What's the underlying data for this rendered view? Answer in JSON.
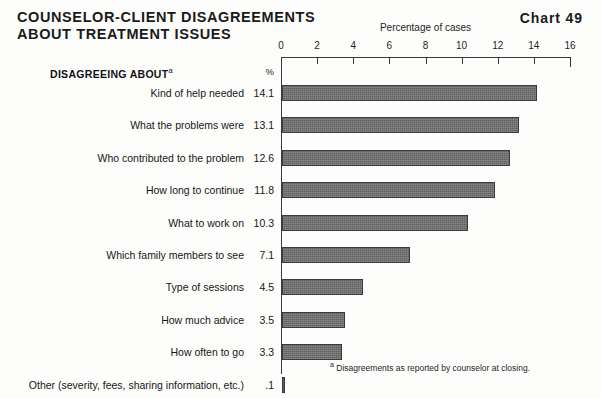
{
  "header": {
    "title_line_1": "COUNSELOR-CLIENT DISAGREEMENTS",
    "title_line_2": "ABOUT TREATMENT ISSUES",
    "chart_number": "Chart 49"
  },
  "columns": {
    "category_heading": "DISAGREEING ABOUT",
    "category_heading_marker": "a",
    "value_heading": "%"
  },
  "footnote": {
    "marker": "a",
    "text": "Disagreements as reported by counselor at closing."
  },
  "chart_data": {
    "type": "bar",
    "orientation": "horizontal",
    "title": "COUNSELOR-CLIENT DISAGREEMENTS ABOUT TREATMENT ISSUES",
    "xlabel": "Percentage of cases",
    "ylabel": "DISAGREEING ABOUT",
    "xlim": [
      0,
      16
    ],
    "xticks": [
      0,
      2,
      4,
      6,
      8,
      10,
      12,
      14,
      16
    ],
    "xticklabels": [
      "0",
      "2",
      "4",
      "6",
      "8",
      "10",
      "12",
      "14",
      "16"
    ],
    "grid": false,
    "legend": false,
    "bar_color": "#6e6e6e",
    "bar_edge_color": "#3b3b3b",
    "categories": [
      "Kind of help needed",
      "What the problems were",
      "Who contributed to the problem",
      "How long to continue",
      "What to work on",
      "Which family members to see",
      "Type of sessions",
      "How much advice",
      "How often to go",
      "Other (severity, fees, sharing information, etc.)"
    ],
    "values": [
      14.1,
      13.1,
      12.6,
      11.8,
      10.3,
      7.1,
      4.5,
      3.5,
      3.3,
      0.1
    ],
    "value_labels": [
      "14.1",
      "13.1",
      "12.6",
      "11.8",
      "10.3",
      "7.1",
      "4.5",
      "3.5",
      "3.3",
      ".1"
    ]
  }
}
